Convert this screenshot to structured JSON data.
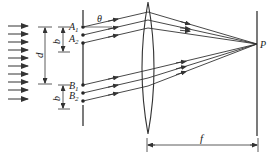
{
  "diagram": {
    "type": "optics-double-slit-pairs-with-lens",
    "labels": {
      "A1": "A",
      "A1_sub": "1",
      "A2": "A",
      "A2_sub": "2",
      "B1": "B",
      "B1_sub": "1",
      "B2": "B",
      "B2_sub": "2",
      "theta": "θ",
      "b_top": "b",
      "b_bottom": "b",
      "d": "d",
      "f": "f",
      "P": "P"
    },
    "incident_arrows_count": 10,
    "colors": {
      "line": "#333333",
      "background": "#ffffff"
    }
  }
}
